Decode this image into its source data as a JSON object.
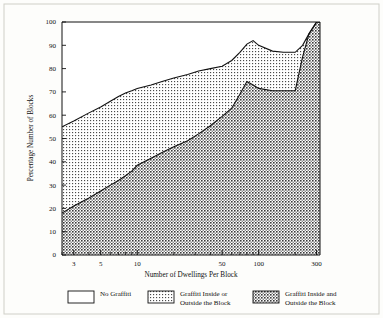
{
  "chart_data": {
    "type": "area",
    "title": "",
    "xlabel": "Number of Dwellings Per Block",
    "ylabel": "Percentage Number of Blocks",
    "xscale": "log",
    "xlim": [
      2.4,
      320
    ],
    "ylim": [
      0,
      100
    ],
    "grid": false,
    "legend_position": "bottom",
    "x_ticks_labeled": [
      3,
      5,
      10,
      50,
      100,
      300
    ],
    "x_tick_labels": [
      "3",
      "5",
      "10",
      "50",
      "100",
      "300"
    ],
    "x_ticks_minor": [
      2.4,
      4,
      6,
      7,
      8,
      9,
      20,
      30,
      40,
      60,
      70,
      80,
      90,
      200
    ],
    "y_ticks": [
      0,
      10,
      20,
      30,
      40,
      50,
      60,
      70,
      80,
      90,
      100
    ],
    "y_tick_labels": [
      "0",
      "10",
      "20",
      "30",
      "40",
      "50",
      "60",
      "70",
      "80",
      "90",
      "100"
    ],
    "x": [
      2.4,
      3,
      4,
      5,
      6,
      7,
      8,
      9,
      10,
      13,
      16,
      20,
      26,
      32,
      40,
      50,
      60,
      70,
      80,
      90,
      100,
      130,
      160,
      200,
      230,
      260,
      300,
      320
    ],
    "series": [
      {
        "name": "Graffiti Inside and Outside the Block",
        "values": [
          18,
          21,
          24.5,
          27.5,
          30,
          32,
          34,
          36,
          38.5,
          41.5,
          44,
          46.5,
          49,
          52,
          55.5,
          59.5,
          63,
          69,
          74.5,
          73,
          71.5,
          70.5,
          70.5,
          70.5,
          85,
          95,
          100,
          100
        ],
        "fill": "dark-crosshatch"
      },
      {
        "name": "Graffiti Inside or Outside the Block",
        "values": [
          55,
          57.5,
          61,
          63.5,
          66,
          68,
          69.5,
          70.5,
          71.5,
          73,
          74.5,
          76,
          77.5,
          79,
          80,
          81,
          83.5,
          87,
          90.5,
          92,
          90,
          87.5,
          87,
          87,
          90,
          95,
          100,
          100
        ],
        "fill": "light-dots"
      },
      {
        "name": "No Graffiti",
        "values": [
          100,
          100,
          100,
          100,
          100,
          100,
          100,
          100,
          100,
          100,
          100,
          100,
          100,
          100,
          100,
          100,
          100,
          100,
          100,
          100,
          100,
          100,
          100,
          100,
          100,
          100,
          100,
          100
        ],
        "fill": "white"
      }
    ],
    "legend": [
      {
        "label_line1": "No Graffiti",
        "label_line2": "",
        "swatch": "white"
      },
      {
        "label_line1": "Graffiti Inside or",
        "label_line2": "Outside the Block",
        "swatch": "light-dots"
      },
      {
        "label_line1": "Graffiti Inside and",
        "label_line2": "Outside the Block",
        "swatch": "dark-crosshatch"
      }
    ]
  }
}
